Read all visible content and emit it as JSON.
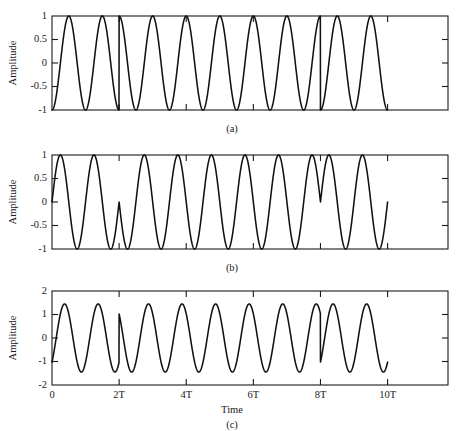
{
  "figure": {
    "background": "#ffffff",
    "curve_color": "#111111",
    "axis_color": "#1a1a1a",
    "shared_xlabel": "Time",
    "shared_ylabel": "Amplitude"
  },
  "panels": [
    {
      "key": "a",
      "caption": "(a)",
      "ylabel": "Amplitude",
      "yticks": [
        1,
        0.5,
        0,
        -0.5,
        -1
      ],
      "ytick_labels": [
        "1",
        "0.5",
        "0",
        "-0.5",
        "-1"
      ],
      "ylim": [
        -1,
        1
      ],
      "xlim": [
        0,
        11.8
      ],
      "xticks": [
        0,
        2,
        4,
        6,
        8,
        10
      ],
      "xtick_labels": [
        "",
        "",
        "",
        "",
        "",
        ""
      ],
      "show_xtick_labels": false
    },
    {
      "key": "b",
      "caption": "(b)",
      "ylabel": "Amplitude",
      "yticks": [
        1,
        0.5,
        0,
        -0.5,
        -1
      ],
      "ytick_labels": [
        "1",
        "0.5",
        "0",
        "-0.5",
        "-1"
      ],
      "ylim": [
        -1,
        1
      ],
      "xlim": [
        0,
        11.8
      ],
      "xticks": [
        0,
        2,
        4,
        6,
        8,
        10
      ],
      "xtick_labels": [
        "",
        "",
        "",
        "",
        "",
        ""
      ],
      "show_xtick_labels": false
    },
    {
      "key": "c",
      "caption": "(c)",
      "ylabel": "Amplitude",
      "xlabel": "Time",
      "yticks": [
        2,
        1,
        0,
        -1,
        -2
      ],
      "ytick_labels": [
        "2",
        "1",
        "0",
        "-1",
        "-2"
      ],
      "ylim": [
        -2,
        2
      ],
      "xlim": [
        0,
        11.8
      ],
      "xticks": [
        0,
        2,
        4,
        6,
        8,
        10
      ],
      "xtick_labels": [
        "0",
        "2T",
        "4T",
        "6T",
        "8T",
        "10T"
      ],
      "show_xtick_labels": true
    }
  ],
  "chart_data": [
    {
      "type": "line",
      "id": "panel-a",
      "title": "(a)",
      "xlabel": "",
      "ylabel": "Amplitude",
      "xlim": [
        0,
        11.8
      ],
      "ylim": [
        -1,
        1
      ],
      "xticks": [
        0,
        2,
        4,
        6,
        8,
        10
      ],
      "xtick_labels": [
        "0",
        "2T",
        "4T",
        "6T",
        "8T",
        "10T"
      ],
      "yticks": [
        -1,
        -0.5,
        0,
        0.5,
        1
      ],
      "grid": false,
      "legend": "none",
      "description": "Carrier sinusoid of amplitude 1 with abrupt 180-degree phase reversals at t=2T and t=8T; 10 cycles drawn from 0 to 10T, blank after 10T.",
      "series": [
        {
          "name": "carrier with phase reversals",
          "amplitude": 1,
          "cycles_per_T": 1,
          "phase_offset_deg": -90,
          "phase_flips_at": [
            2,
            8
          ],
          "t_start": 0,
          "t_end": 10,
          "start_value": -1,
          "end_value": 1
        }
      ]
    },
    {
      "type": "line",
      "id": "panel-b",
      "title": "(b)",
      "xlabel": "",
      "ylabel": "Amplitude",
      "xlim": [
        0,
        11.8
      ],
      "ylim": [
        -1,
        1
      ],
      "xticks": [
        0,
        2,
        4,
        6,
        8,
        10
      ],
      "xtick_labels": [
        "0",
        "2T",
        "4T",
        "6T",
        "8T",
        "10T"
      ],
      "yticks": [
        -1,
        -0.5,
        0,
        0.5,
        1
      ],
      "grid": false,
      "legend": "none",
      "description": "Modulating sinusoid of amplitude 1 starting at 0 rising; phase discontinuities at t=2T (notch up to 0 then back down) and t=8T (dip to 0 then back up); ends at t=10T at value 0 rising.",
      "series": [
        {
          "name": "modulating wave with phase steps",
          "amplitude": 1,
          "cycles_per_T": 1,
          "phase_offset_deg": 0,
          "phase_flips_at": [
            2,
            8
          ],
          "t_start": 0,
          "t_end": 10,
          "start_value": 0,
          "end_value": 0
        }
      ]
    },
    {
      "type": "line",
      "id": "panel-c",
      "title": "(c)",
      "xlabel": "Time",
      "ylabel": "Amplitude",
      "xlim": [
        0,
        11.8
      ],
      "ylim": [
        -2,
        2
      ],
      "xticks": [
        0,
        2,
        4,
        6,
        8,
        10
      ],
      "xtick_labels": [
        "0",
        "2T",
        "4T",
        "6T",
        "8T",
        "10T"
      ],
      "yticks": [
        -2,
        -1,
        0,
        1,
        2
      ],
      "grid": false,
      "legend": "none",
      "description": "Sum of (a) and (b): composite wave with peak amplitude about 1.45 and vertical jumps at t=2T and t=8T; starts near -1 at t=0 and ends near +1 at t=10T.",
      "series": [
        {
          "name": "composite sum",
          "amplitude": 1.45,
          "cycles_per_T": 1,
          "phase_offset_deg": -45,
          "phase_flips_at": [
            2,
            8
          ],
          "t_start": 0,
          "t_end": 10,
          "start_value": -1,
          "end_value": 1
        }
      ]
    }
  ]
}
